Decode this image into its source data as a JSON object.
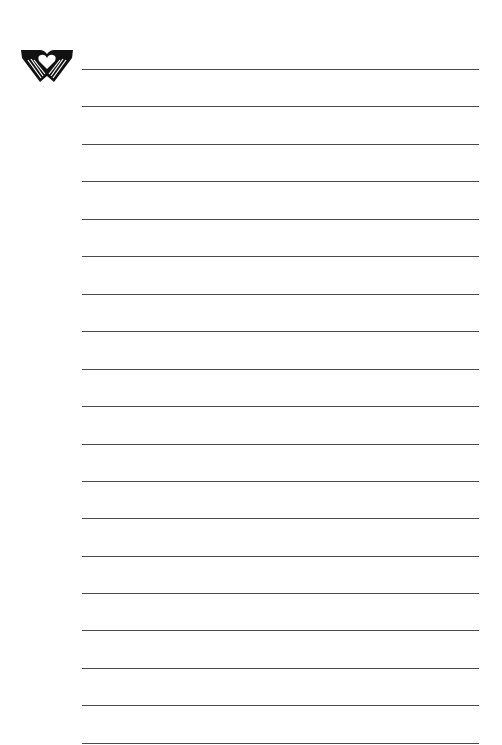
{
  "document": {
    "type": "lined-stationery",
    "logo": {
      "icon": "hands-heart-icon",
      "color": "#111111"
    },
    "rule_color": "#4a4a4a",
    "rules": [
      69,
      106,
      144,
      181,
      219,
      256,
      294,
      331,
      369,
      406,
      444,
      481,
      518,
      556,
      593,
      630,
      668,
      705,
      743
    ]
  }
}
